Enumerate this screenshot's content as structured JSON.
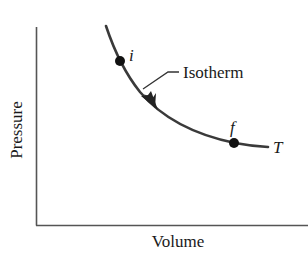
{
  "diagram": {
    "type": "pv-diagram",
    "axes": {
      "x_label": "Volume",
      "y_label": "Pressure"
    },
    "curve": {
      "name": "Isotherm",
      "temperature_label": "T",
      "direction": "i-to-f"
    },
    "points": [
      {
        "id": "i",
        "label": "i"
      },
      {
        "id": "f",
        "label": "f"
      }
    ],
    "colors": {
      "axis": "#555555",
      "curve": "#3a3a3a",
      "point": "#111111",
      "text": "#1a1a1a"
    }
  }
}
